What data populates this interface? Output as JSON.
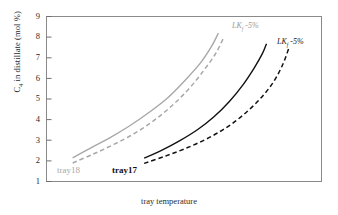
{
  "chart_data": {
    "type": "line",
    "title": "",
    "xlabel": "tray temperature",
    "ylabel": "C4 in distillate (mol %)",
    "ylim": [
      1,
      9
    ],
    "yticks": [
      9,
      8,
      7,
      6,
      5,
      4,
      3,
      2,
      1
    ],
    "ytick_labels": [
      "9",
      "8",
      "7",
      "6",
      "5",
      "4",
      "3",
      "2",
      "1"
    ],
    "xticks": [],
    "xtick_labels": [],
    "grid": false,
    "legend_position": "inline-annotations",
    "axis_frame": "box",
    "colors": {
      "tray18": "#a8a8a8",
      "tray17": "#111111",
      "frame": "#8a8a8a"
    },
    "series": [
      {
        "name": "tray18 base",
        "group": "tray18",
        "style": "solid",
        "color": "#a8a8a8",
        "x": [
          0.095,
          0.16,
          0.23,
          0.3,
          0.37,
          0.44,
          0.5,
          0.56,
          0.6,
          0.625
        ],
        "y": [
          2.15,
          2.62,
          3.12,
          3.68,
          4.32,
          5.05,
          5.85,
          6.75,
          7.55,
          8.2
        ]
      },
      {
        "name": "tray18 LKf -5%",
        "group": "tray18",
        "style": "dashed",
        "color": "#a8a8a8",
        "x": [
          0.095,
          0.17,
          0.245,
          0.32,
          0.39,
          0.455,
          0.515,
          0.57,
          0.615,
          0.645
        ],
        "y": [
          1.9,
          2.33,
          2.8,
          3.33,
          3.95,
          4.66,
          5.45,
          6.35,
          7.2,
          8.0
        ]
      },
      {
        "name": "tray17 base",
        "group": "tray17",
        "style": "solid",
        "color": "#111111",
        "x": [
          0.355,
          0.42,
          0.485,
          0.55,
          0.61,
          0.665,
          0.715,
          0.755,
          0.785,
          0.8
        ],
        "y": [
          2.13,
          2.52,
          2.98,
          3.52,
          4.15,
          4.88,
          5.7,
          6.5,
          7.2,
          7.68
        ]
      },
      {
        "name": "tray17 LKf -5%",
        "group": "tray17",
        "style": "dashed",
        "color": "#111111",
        "x": [
          0.355,
          0.43,
          0.505,
          0.58,
          0.65,
          0.715,
          0.775,
          0.825,
          0.86,
          0.882
        ],
        "y": [
          1.88,
          2.22,
          2.6,
          3.05,
          3.58,
          4.22,
          4.98,
          5.82,
          6.7,
          7.5
        ]
      }
    ],
    "annotations": [
      {
        "text": "LK",
        "sub": "f",
        "suffix": " -5%",
        "color": "#9a9a9a",
        "target": "tray18-dashed"
      },
      {
        "text": "LK",
        "sub": "f",
        "suffix": " -5%",
        "color": "#1a1a1a",
        "target": "tray17-dashed"
      }
    ],
    "series_labels": [
      {
        "text": "tray18",
        "color": "#a8a8a8"
      },
      {
        "text": "tray17",
        "color": "#111111"
      }
    ]
  },
  "axis": {
    "y_label_main": "C",
    "y_label_sub": "4",
    "y_label_rest": " in distillate (mol %)",
    "x_label": "tray temperature",
    "ticks": [
      "9",
      "8",
      "7",
      "6",
      "5",
      "4",
      "3",
      "2",
      "1"
    ]
  },
  "annotations": {
    "gray_lk": {
      "base": "LK",
      "sub": "f",
      "tail": " -5%"
    },
    "black_lk": {
      "base": "LK",
      "sub": "f",
      "tail": " -5%"
    }
  },
  "labels": {
    "tray18": "tray18",
    "tray17": "tray17"
  }
}
